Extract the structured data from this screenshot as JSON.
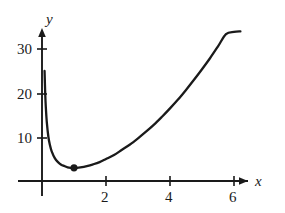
{
  "figure": {
    "background_color": "#ffffff",
    "ink_color": "#1a1a1a"
  },
  "chart_data": {
    "type": "line",
    "title": "",
    "subtitle": "",
    "xlabel": "x",
    "ylabel": "y",
    "xlim": [
      0,
      6.6
    ],
    "ylim": [
      0,
      35
    ],
    "grid": false,
    "legend": null,
    "axis_style": "arrows",
    "series": [
      {
        "name": "curve",
        "comment": "smooth convex curve, vertical asymptote at x=0, minimum near x=1",
        "x": [
          0.08,
          0.1,
          0.12,
          0.15,
          0.2,
          0.25,
          0.3,
          0.4,
          0.5,
          0.6,
          0.7,
          0.8,
          0.9,
          1.0,
          1.1,
          1.2,
          1.4,
          1.6,
          1.8,
          2.0,
          2.25,
          2.5,
          2.75,
          3.0,
          3.25,
          3.5,
          3.75,
          4.0,
          4.25,
          4.5,
          4.75,
          5.0,
          5.25,
          5.5,
          5.75,
          6.0,
          6.2
        ],
        "y": [
          25.0,
          20.0,
          16.7,
          13.4,
          10.0,
          8.1,
          6.8,
          5.2,
          4.3,
          3.7,
          3.4,
          3.1,
          3.0,
          3.0,
          3.0,
          3.1,
          3.4,
          3.8,
          4.3,
          5.0,
          5.9,
          7.1,
          8.3,
          9.7,
          11.2,
          12.8,
          14.6,
          16.5,
          18.5,
          20.7,
          23.0,
          25.4,
          27.9,
          30.6,
          33.4,
          33.9,
          34.0
        ]
      }
    ],
    "x_ticks": [
      {
        "value": 2,
        "label": "2"
      },
      {
        "value": 4,
        "label": "4"
      },
      {
        "value": 6,
        "label": "6"
      }
    ],
    "y_ticks": [
      {
        "value": 10,
        "label": "10"
      },
      {
        "value": 20,
        "label": "20"
      },
      {
        "value": 30,
        "label": "30"
      }
    ],
    "annotations": [
      {
        "kind": "point-marker",
        "label": "",
        "x": 1,
        "y": 3,
        "style": "filled-dot"
      }
    ]
  }
}
